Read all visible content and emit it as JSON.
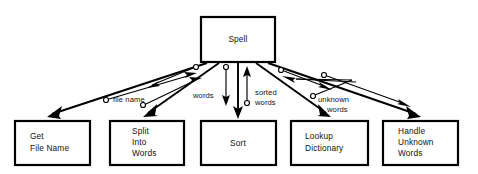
{
  "diagram": {
    "type": "structure-chart",
    "colors": {
      "background": "#ffffff",
      "stroke": "#000000",
      "text": "#111111",
      "box_fill": "#ffffff"
    },
    "modules": [
      {
        "id": "spell",
        "name": "Spell",
        "lines": [
          "Spell"
        ],
        "level": 0,
        "align": "center",
        "x": 201,
        "y": 17,
        "w": 74,
        "h": 45
      },
      {
        "id": "get-file-name",
        "name": "Get File Name",
        "lines": [
          "Get",
          "File Name"
        ],
        "level": 1,
        "align": "left",
        "x": 15,
        "y": 121,
        "w": 75,
        "h": 44
      },
      {
        "id": "split-into-words",
        "name": "Split Into Words",
        "lines": [
          "Split",
          "Into",
          "Words"
        ],
        "level": 1,
        "align": "left",
        "x": 110,
        "y": 121,
        "w": 74,
        "h": 44
      },
      {
        "id": "sort",
        "name": "Sort",
        "lines": [
          "Sort"
        ],
        "level": 1,
        "align": "center",
        "x": 201,
        "y": 121,
        "w": 75,
        "h": 44
      },
      {
        "id": "lookup-dictionary",
        "name": "Lookup Dictionary",
        "lines": [
          "Lookup",
          "Dictionary"
        ],
        "level": 1,
        "align": "left",
        "x": 291,
        "y": 121,
        "w": 77,
        "h": 44
      },
      {
        "id": "handle-unknown-words",
        "name": "Handle Unknown Words",
        "lines": [
          "Handle",
          "Unknown",
          "Words"
        ],
        "level": 1,
        "align": "left",
        "x": 383,
        "y": 121,
        "w": 75,
        "h": 44
      }
    ],
    "calls": [
      {
        "id": "call-get-file-name",
        "from": "spell",
        "to": "get-file-name"
      },
      {
        "id": "call-split-into-words",
        "from": "spell",
        "to": "split-into-words"
      },
      {
        "id": "call-sort",
        "from": "spell",
        "to": "sort"
      },
      {
        "id": "call-lookup-dictionary",
        "from": "spell",
        "to": "lookup-dictionary"
      },
      {
        "id": "call-handle-unknown-words",
        "from": "spell",
        "to": "handle-unknown-words"
      }
    ],
    "data_couples": [
      {
        "id": "couple-file-name-up",
        "label": "file name",
        "from": "get-file-name",
        "to": "spell",
        "direction": "up",
        "label_x": 113,
        "label_y": 101
      },
      {
        "id": "couple-file-name-down",
        "label": "",
        "from": "spell",
        "to": "split-into-words",
        "direction": "down",
        "label_x": 0,
        "label_y": 0
      },
      {
        "id": "couple-words-up",
        "label": "",
        "from": "split-into-words",
        "to": "spell",
        "direction": "up",
        "label_x": 0,
        "label_y": 0
      },
      {
        "id": "couple-words-down",
        "label": "words",
        "from": "spell",
        "to": "sort",
        "direction": "down",
        "label_x": 196,
        "label_y": 96
      },
      {
        "id": "couple-sorted-words-up",
        "label": "sorted words",
        "from": "sort",
        "to": "spell",
        "direction": "up",
        "label_x": 245,
        "label_y": 96
      },
      {
        "id": "couple-sorted-words-down",
        "label": "",
        "from": "spell",
        "to": "lookup-dictionary",
        "direction": "down",
        "label_x": 0,
        "label_y": 0
      },
      {
        "id": "couple-unknown-words-up",
        "label": "unknown words",
        "from": "lookup-dictionary",
        "to": "spell",
        "direction": "up",
        "label_x": 318,
        "label_y": 101
      },
      {
        "id": "couple-unknown-words-down",
        "label": "",
        "from": "spell",
        "to": "handle-unknown-words",
        "direction": "down",
        "label_x": 0,
        "label_y": 0
      }
    ],
    "flow_labels": [
      {
        "id": "label-file-name",
        "text": "file name",
        "lines": [
          "file name"
        ],
        "x": 113,
        "y": 101
      },
      {
        "id": "label-words",
        "text": "words",
        "lines": [
          "words"
        ],
        "x": 194,
        "y": 96
      },
      {
        "id": "label-sorted-words",
        "text": "sorted words",
        "lines": [
          "sorted",
          "words"
        ],
        "x": 244,
        "y": 94
      },
      {
        "id": "label-unknown-words",
        "text": "unknown words",
        "lines": [
          "unknown",
          "words"
        ],
        "x": 316,
        "y": 99
      }
    ]
  }
}
